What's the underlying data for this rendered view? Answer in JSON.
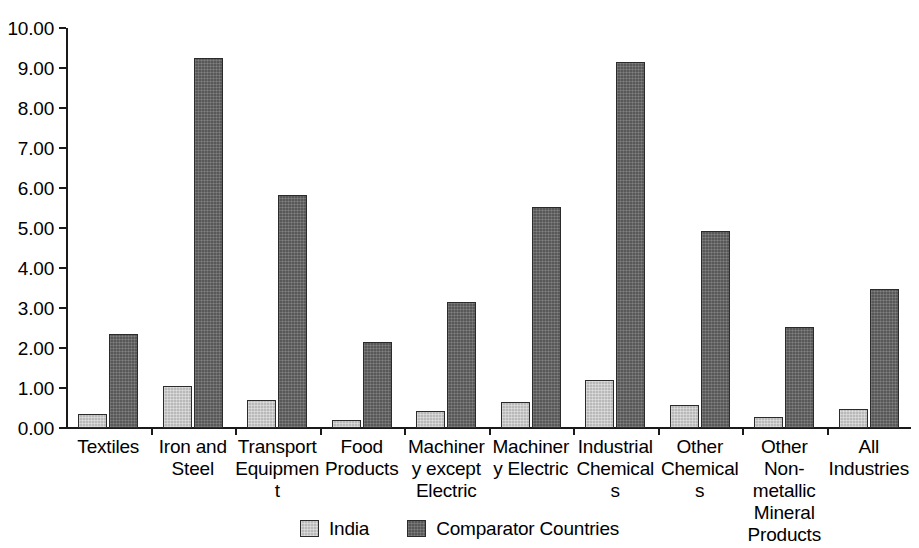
{
  "chart_data": {
    "type": "bar",
    "title": "",
    "subtitle": "",
    "xlabel": "",
    "ylabel": "",
    "ylim": [
      0,
      10
    ],
    "ytick_labels": [
      "10.00",
      "9.00",
      "8.00",
      "7.00",
      "6.00",
      "5.00",
      "4.00",
      "3.00",
      "2.00",
      "1.00",
      "0.00"
    ],
    "ytick_values": [
      10,
      9,
      8,
      7,
      6,
      5,
      4,
      3,
      2,
      1,
      0
    ],
    "grid": false,
    "legend_position": "bottom-center",
    "categories": [
      "Textiles",
      "Iron and Steel",
      "Transport Equipment",
      "Food Products",
      "Machinery except Electric",
      "Machinery Electric",
      "Industrial Chemicals",
      "Other Chemicals",
      "Other Non-metallic Mineral Products",
      "All Industries"
    ],
    "series": [
      {
        "name": "India",
        "color": "#b9b9b9",
        "values": [
          0.35,
          1.05,
          0.7,
          0.2,
          0.43,
          0.65,
          1.2,
          0.57,
          0.28,
          0.48
        ]
      },
      {
        "name": "Comparator Countries",
        "color": "#585858",
        "values": [
          2.35,
          9.25,
          5.83,
          2.15,
          3.15,
          5.53,
          9.15,
          4.93,
          2.53,
          3.47
        ]
      }
    ]
  },
  "legend": {
    "items": [
      {
        "label": "India",
        "swatch": "india"
      },
      {
        "label": "Comparator Countries",
        "swatch": "comparator"
      }
    ]
  }
}
